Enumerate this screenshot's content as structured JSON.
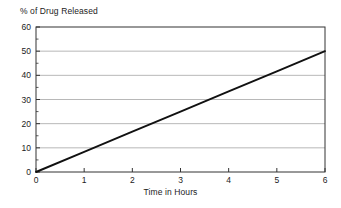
{
  "chart_data": {
    "type": "line",
    "title": "",
    "ylabel": "% of Drug Released",
    "xlabel": "Time in Hours",
    "x": [
      0,
      1,
      2,
      3,
      4,
      5,
      6
    ],
    "values": [
      0,
      8.33,
      16.67,
      25,
      33.33,
      41.67,
      50
    ],
    "series": [
      {
        "name": "% of Drug Released",
        "values": [
          0,
          8.33,
          16.67,
          25,
          33.33,
          41.67,
          50
        ]
      }
    ],
    "xlim": [
      0,
      6
    ],
    "ylim": [
      0,
      60
    ],
    "x_ticks": [
      "0",
      "1",
      "2",
      "3",
      "4",
      "5",
      "6"
    ],
    "y_ticks": [
      "0",
      "10",
      "20",
      "30",
      "40",
      "50",
      "60"
    ],
    "y_minor_ticks": [
      5,
      15,
      25,
      35,
      45,
      55
    ],
    "grid": "horizontal",
    "legend": "none",
    "line_color": "#111111",
    "grid_color": "#9a9a9a",
    "axis_color": "#333333",
    "background": "#ffffff"
  },
  "axes": {
    "y_axis_title": "% of Drug Released",
    "x_axis_title": "Time in Hours"
  }
}
